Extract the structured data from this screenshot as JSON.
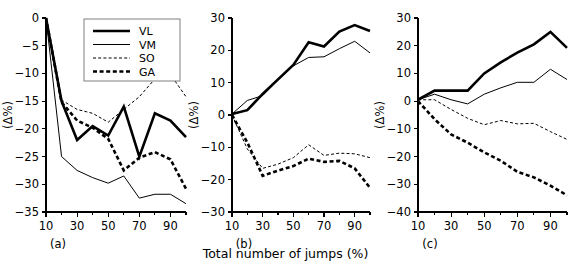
{
  "figure": {
    "xlabel": "Total number of jumps (%)",
    "ylabel": "(Δ%)",
    "series_names": [
      "VL",
      "VM",
      "SO",
      "GA"
    ]
  },
  "legend": {
    "position": "panel-a-top-right",
    "entries": [
      {
        "label": "VL",
        "style": "thick-solid"
      },
      {
        "label": "VM",
        "style": "thin-solid"
      },
      {
        "label": "SO",
        "style": "thin-dashed"
      },
      {
        "label": "GA",
        "style": "thick-dashed"
      }
    ]
  },
  "chart_data": [
    {
      "type": "line",
      "panel": "a",
      "panel_label": "(a)",
      "title": "",
      "xlabel": "Total number of jumps (%)",
      "ylabel": "(Δ%)",
      "x": [
        10,
        20,
        30,
        40,
        50,
        60,
        70,
        80,
        90,
        100
      ],
      "xlim": [
        10,
        100
      ],
      "ylim": [
        -35,
        0
      ],
      "xticks": [
        10,
        20,
        30,
        40,
        50,
        60,
        70,
        80,
        90,
        100
      ],
      "xticklabels": [
        "10",
        "",
        "30",
        "",
        "50",
        "",
        "70",
        "",
        "90",
        ""
      ],
      "yticks": [
        0,
        -5,
        -10,
        -15,
        -20,
        -25,
        -30,
        -35
      ],
      "yticklabels": [
        "0",
        "−5",
        "−10",
        "−15",
        "−20",
        "−25",
        "−30",
        "−35"
      ],
      "grid": false,
      "series": [
        {
          "name": "VL",
          "values": [
            0,
            -15.0,
            -22.0,
            -19.5,
            -21.2,
            -16.0,
            -25.0,
            -17.2,
            -18.5,
            -21.5
          ]
        },
        {
          "name": "VM",
          "values": [
            0,
            -25.0,
            -27.5,
            -28.8,
            -29.8,
            -28.5,
            -32.5,
            -31.8,
            -31.8,
            -33.5
          ]
        },
        {
          "name": "SO",
          "values": [
            0,
            -14.8,
            -16.5,
            -17.2,
            -18.8,
            -16.5,
            -14.2,
            -11.0,
            -10.2,
            -14.2
          ]
        },
        {
          "name": "GA",
          "values": [
            0,
            -15.2,
            -18.5,
            -19.8,
            -21.8,
            -27.5,
            -25.2,
            -24.2,
            -25.5,
            -30.8
          ]
        }
      ]
    },
    {
      "type": "line",
      "panel": "b",
      "panel_label": "(b)",
      "title": "",
      "xlabel": "Total number of jumps (%)",
      "ylabel": "(Δ%)",
      "x": [
        10,
        20,
        30,
        40,
        50,
        60,
        70,
        80,
        90,
        100
      ],
      "xlim": [
        10,
        100
      ],
      "ylim": [
        -30,
        30
      ],
      "xticks": [
        10,
        20,
        30,
        40,
        50,
        60,
        70,
        80,
        90,
        100
      ],
      "xticklabels": [
        "10",
        "",
        "30",
        "",
        "50",
        "",
        "70",
        "",
        "90",
        ""
      ],
      "yticks": [
        30,
        20,
        10,
        0,
        -10,
        -20,
        -30
      ],
      "yticklabels": [
        "30",
        "20",
        "10",
        "0",
        "−10",
        "−20",
        "−30"
      ],
      "grid": false,
      "series": [
        {
          "name": "VL",
          "values": [
            0.3,
            1.5,
            6.5,
            11.0,
            15.5,
            22.5,
            21.2,
            25.8,
            27.8,
            26.0
          ]
        },
        {
          "name": "VM",
          "values": [
            0.3,
            4.5,
            6.0,
            10.8,
            15.2,
            17.8,
            18.0,
            20.5,
            22.8,
            19.2
          ]
        },
        {
          "name": "SO",
          "values": [
            0,
            -10.5,
            -16.5,
            -15.2,
            -13.2,
            -9.2,
            -12.5,
            -11.8,
            -12.0,
            -13.2
          ]
        },
        {
          "name": "GA",
          "values": [
            0,
            -8.5,
            -18.8,
            -17.2,
            -15.8,
            -13.5,
            -14.5,
            -14.2,
            -16.5,
            -22.5
          ]
        }
      ]
    },
    {
      "type": "line",
      "panel": "c",
      "panel_label": "(c)",
      "title": "",
      "xlabel": "Total number of jumps (%)",
      "ylabel": "(Δ%)",
      "x": [
        10,
        20,
        30,
        40,
        50,
        60,
        70,
        80,
        90,
        100
      ],
      "xlim": [
        10,
        100
      ],
      "ylim": [
        -40,
        30
      ],
      "xticks": [
        10,
        20,
        30,
        40,
        50,
        60,
        70,
        80,
        90,
        100
      ],
      "xticklabels": [
        "10",
        "",
        "30",
        "",
        "50",
        "",
        "70",
        "",
        "90",
        ""
      ],
      "yticks": [
        30,
        20,
        10,
        0,
        -10,
        -20,
        -30,
        -40
      ],
      "yticklabels": [
        "30",
        "20",
        "10",
        "0",
        "−10",
        "−20",
        "−30",
        "−40"
      ],
      "grid": false,
      "series": [
        {
          "name": "VL",
          "values": [
            0.5,
            3.8,
            3.8,
            3.8,
            10.0,
            14.0,
            17.5,
            20.5,
            25.0,
            19.2
          ]
        },
        {
          "name": "VM",
          "values": [
            0.5,
            2.5,
            0.5,
            -1.0,
            2.5,
            4.8,
            6.8,
            6.8,
            11.5,
            7.8
          ]
        },
        {
          "name": "SO",
          "values": [
            0.5,
            0.5,
            -3.0,
            -6.2,
            -8.5,
            -7.0,
            -8.2,
            -8.0,
            -11.0,
            -13.8
          ]
        },
        {
          "name": "GA",
          "values": [
            0,
            -6.5,
            -12.0,
            -15.0,
            -18.5,
            -21.5,
            -25.5,
            -27.5,
            -30.5,
            -34.0
          ]
        }
      ]
    }
  ]
}
